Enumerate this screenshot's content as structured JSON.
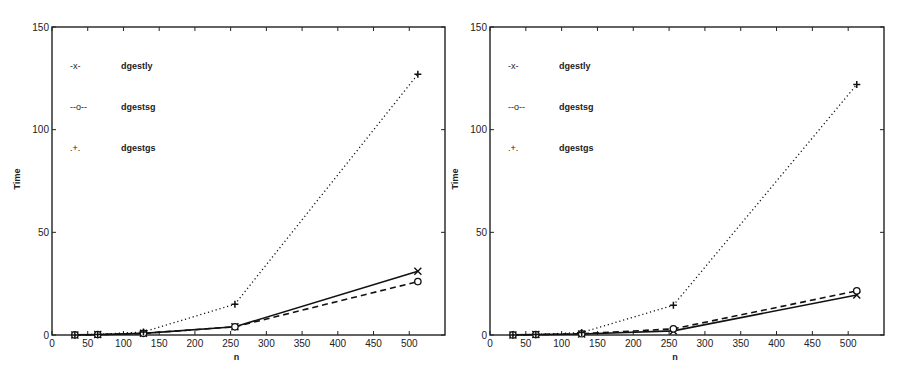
{
  "chart_data": [
    {
      "type": "line",
      "title": "",
      "xlabel": "n",
      "ylabel": "Time",
      "xlim": [
        0,
        550
      ],
      "ylim": [
        0,
        150
      ],
      "xticks": [
        0,
        50,
        100,
        150,
        200,
        250,
        300,
        350,
        400,
        450,
        500
      ],
      "yticks": [
        0,
        50,
        100,
        150
      ],
      "grid": false,
      "legend_position": "top-left",
      "x": [
        32,
        64,
        128,
        256,
        512
      ],
      "series": [
        {
          "name": "dgestly",
          "legend_symbol": "-x-",
          "marker": "x",
          "style": "solid",
          "values": [
            0.05,
            0.2,
            0.8,
            4.0,
            31
          ]
        },
        {
          "name": "dgestsg",
          "legend_symbol": "--o--",
          "marker": "o",
          "style": "dashed",
          "values": [
            0.05,
            0.2,
            0.8,
            4.0,
            26
          ]
        },
        {
          "name": "dgestgs",
          "legend_symbol": ".+.",
          "marker": "+",
          "style": "dotted",
          "values": [
            0.05,
            0.3,
            1.5,
            15,
            127
          ]
        }
      ]
    },
    {
      "type": "line",
      "title": "",
      "xlabel": "n",
      "ylabel": "Time",
      "xlim": [
        0,
        550
      ],
      "ylim": [
        0,
        150
      ],
      "xticks": [
        0,
        50,
        100,
        150,
        200,
        250,
        300,
        350,
        400,
        450,
        500
      ],
      "yticks": [
        0,
        50,
        100,
        150
      ],
      "grid": false,
      "legend_position": "top-left",
      "x": [
        32,
        64,
        128,
        256,
        512
      ],
      "series": [
        {
          "name": "dgestly",
          "legend_symbol": "-x-",
          "marker": "x",
          "style": "solid",
          "values": [
            0.05,
            0.2,
            0.5,
            2.0,
            19.5
          ]
        },
        {
          "name": "dgestsg",
          "legend_symbol": "--o--",
          "marker": "o",
          "style": "dashed",
          "values": [
            0.05,
            0.2,
            0.6,
            3.0,
            21.5
          ]
        },
        {
          "name": "dgestgs",
          "legend_symbol": ".+.",
          "marker": "+",
          "style": "dotted",
          "values": [
            0.05,
            0.3,
            1.2,
            14.5,
            122
          ]
        }
      ]
    }
  ]
}
